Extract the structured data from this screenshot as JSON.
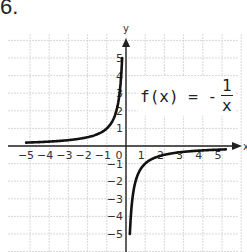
{
  "problem": {
    "number_label": "6."
  },
  "function_label": {
    "lhs": "f(x) = -",
    "numerator": "1",
    "denominator": "x"
  },
  "axes": {
    "x_label": "x",
    "y_label": "y"
  },
  "colors": {
    "grid": "#d8d8d8",
    "axis": "#222222",
    "curve": "#111111",
    "text": "#333333"
  },
  "chart_data": {
    "type": "line",
    "xlabel": "x",
    "ylabel": "y",
    "xlim": [
      -5,
      5
    ],
    "ylim": [
      -5,
      5
    ],
    "grid": true,
    "x_ticks": [
      -5,
      -4,
      -3,
      -2,
      -1,
      0,
      1,
      2,
      3,
      4,
      5
    ],
    "y_ticks": [
      -5,
      -4,
      -3,
      -2,
      -1,
      1,
      2,
      3,
      4,
      5
    ],
    "x_tick_labels": [
      "-5",
      "-4",
      "-3",
      "-2",
      "-1",
      "0",
      "1",
      "2",
      "3",
      "4",
      "5"
    ],
    "y_tick_labels": [
      "-5",
      "-4",
      "-3",
      "-2",
      "-1",
      "1",
      "2",
      "3",
      "4",
      "5"
    ],
    "series": [
      {
        "name": "f(x) = -1/x (x < 0)",
        "x": [
          -5,
          -4,
          -3,
          -2,
          -1,
          -0.5,
          -0.33,
          -0.25,
          -0.2
        ],
        "y": [
          0.2,
          0.25,
          0.33,
          0.5,
          1,
          2,
          3,
          4,
          5
        ]
      },
      {
        "name": "f(x) = -1/x (x > 0)",
        "x": [
          0.2,
          0.25,
          0.33,
          0.5,
          1,
          2,
          3,
          4,
          5
        ],
        "y": [
          -5,
          -4,
          -3,
          -2,
          -1,
          -0.5,
          -0.33,
          -0.25,
          -0.2
        ]
      }
    ]
  }
}
